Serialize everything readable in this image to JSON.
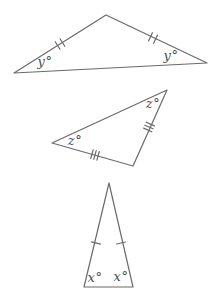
{
  "diagram": {
    "background_color": "#ffffff",
    "stroke_color": "#6a6a6a",
    "label_color": "#4d4d4d",
    "triangles": [
      {
        "id": "top",
        "shape": "wide obtuse triangle",
        "tick_marks_per_marked_side": 2,
        "marked_sides": 2,
        "labels": [
          {
            "position": "bottom-left-angle",
            "text": "y°"
          },
          {
            "position": "bottom-right-angle",
            "text": "y°"
          }
        ]
      },
      {
        "id": "middle",
        "shape": "tilted triangle",
        "tick_marks_per_marked_side": 3,
        "marked_sides": 2,
        "labels": [
          {
            "position": "left-angle",
            "text": "z°"
          },
          {
            "position": "top-right-angle",
            "text": "z°"
          }
        ]
      },
      {
        "id": "bottom",
        "shape": "tall narrow isosceles triangle",
        "tick_marks_per_marked_side": 1,
        "marked_sides": 2,
        "labels": [
          {
            "position": "bottom-left-angle",
            "text": "x°"
          },
          {
            "position": "bottom-right-angle",
            "text": "x°"
          }
        ]
      }
    ]
  }
}
